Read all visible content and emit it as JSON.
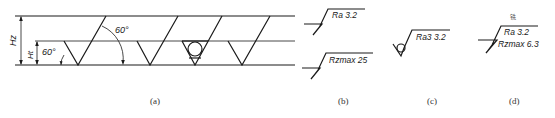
{
  "figure": {
    "panels": [
      {
        "id": "a",
        "caption": "(a)",
        "dimensions": {
          "outer_height_label": "Hz",
          "inner_height_label": "Ht"
        },
        "angles": [
          "60°",
          "60°"
        ],
        "symbols": [
          "basic-surface-symbol",
          "basic-surface-symbol",
          "circle-surface-symbol",
          "basic-surface-symbol"
        ]
      },
      {
        "id": "b",
        "caption": "(b)",
        "symbols": [
          {
            "text": "Ra 3.2"
          },
          {
            "text": "Rzmax 25"
          }
        ]
      },
      {
        "id": "c",
        "caption": "(c)",
        "symbols": [
          {
            "text": "Ra3 3.2",
            "type": "circle-symbol"
          }
        ]
      },
      {
        "id": "d",
        "caption": "(d)",
        "process_note": "铣",
        "symbols": [
          {
            "line1": "Ra  3.2",
            "line2": "Rzmax  6.3"
          }
        ]
      }
    ]
  },
  "colors": {
    "ink": "#1a1a1a",
    "caption": "#333333",
    "background": "#ffffff"
  }
}
